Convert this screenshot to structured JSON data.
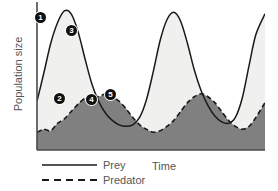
{
  "chart_data": {
    "type": "area",
    "title": "",
    "xlabel": "Time",
    "ylabel": "Population size",
    "grid": false,
    "legend_position": "bottom-left",
    "axis_ranges": {
      "x": [
        0,
        100
      ],
      "y": [
        0,
        100
      ]
    },
    "series": [
      {
        "name": "Prey",
        "style": "solid",
        "fill": "#f0f0ee",
        "line_color": "#1a1a1a",
        "x": [
          0,
          3,
          6,
          9,
          12,
          15,
          18,
          21,
          24,
          27,
          30,
          33,
          36,
          39,
          42,
          45,
          48,
          51,
          54,
          57,
          60,
          63,
          66,
          69,
          72,
          75,
          78,
          81,
          84,
          87,
          90,
          93,
          96,
          100
        ],
        "values": [
          33,
          52,
          72,
          86,
          94,
          92,
          80,
          62,
          45,
          33,
          25,
          20,
          17,
          16,
          17,
          22,
          34,
          53,
          74,
          88,
          93,
          87,
          72,
          54,
          40,
          30,
          23,
          19,
          18,
          22,
          35,
          57,
          78,
          92
        ]
      },
      {
        "name": "Predator",
        "style": "dashed",
        "fill": "#808080",
        "line_color": "#1a1a1a",
        "x": [
          0,
          3,
          6,
          9,
          12,
          15,
          18,
          21,
          24,
          27,
          30,
          33,
          36,
          39,
          42,
          45,
          48,
          51,
          54,
          57,
          60,
          63,
          66,
          69,
          72,
          75,
          78,
          81,
          84,
          87,
          90,
          93,
          96,
          100
        ],
        "values": [
          12,
          14,
          13,
          18,
          21,
          26,
          31,
          35,
          37,
          36,
          38,
          36,
          33,
          28,
          22,
          17,
          14,
          12,
          13,
          16,
          20,
          26,
          32,
          36,
          38,
          36,
          32,
          26,
          20,
          16,
          14,
          16,
          22,
          32
        ]
      }
    ],
    "annotations": [
      {
        "id": "1",
        "label": "1",
        "x_px": 40,
        "y_px": 17,
        "description": "prey-population-rising"
      },
      {
        "id": "2",
        "label": "2",
        "x_px": 59,
        "y_px": 98,
        "description": "predator-population-low"
      },
      {
        "id": "3",
        "label": "3",
        "x_px": 71,
        "y_px": 30,
        "description": "prey-population-falling"
      },
      {
        "id": "4",
        "label": "4",
        "x_px": 91,
        "y_px": 99,
        "description": "predator-population-peak-lag"
      },
      {
        "id": "5",
        "label": "5",
        "x_px": 110,
        "y_px": 94,
        "description": "prey-recovery-begins"
      }
    ]
  },
  "axes": {
    "y_label": "Population size",
    "x_label": "Time"
  },
  "legend": {
    "entries": [
      {
        "label": "Prey",
        "style": "solid"
      },
      {
        "label": "Predator",
        "style": "dashed"
      }
    ]
  },
  "colors": {
    "prey_fill": "#f0f0ee",
    "predator_fill": "#808080",
    "line": "#1a1a1a",
    "axis": "#4a4a4a",
    "text": "#555555",
    "background": "#ffffff"
  }
}
